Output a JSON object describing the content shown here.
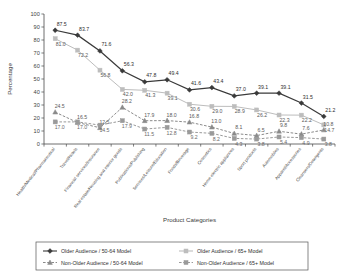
{
  "chart_data": {
    "type": "line",
    "title": "",
    "xlabel": "Product Categories",
    "ylabel": "Percentage",
    "ylim": [
      0,
      100
    ],
    "yticks": [
      0,
      10,
      20,
      30,
      40,
      50,
      60,
      70,
      80,
      90,
      100
    ],
    "grid": false,
    "legend_position": "bottom",
    "categories": [
      "Health/Medical/Pharmaceutical",
      "Travel/Hotels",
      "Financial services/Insurance",
      "Real estate/Housing and interior goods",
      "Publications/Publishing",
      "Services/Leisure/Education",
      "Foods/Beverage",
      "Cosmetics",
      "Home electric appliances",
      "Sport products",
      "Automobiles",
      "Apparel/Accessories",
      "Cleansers/Detergents"
    ],
    "series": [
      {
        "name": "Older Audience / 50-64 Model",
        "color": "#3a3a3a",
        "marker": "diamond",
        "dash": "none",
        "values": [
          87.5,
          83.7,
          71.6,
          56.3,
          47.8,
          49.4,
          41.6,
          43.4,
          37.0,
          39.1,
          39.1,
          31.5,
          21.2
        ]
      },
      {
        "name": "Older Audience / 65+ Model",
        "color": "#bdbdbd",
        "marker": "square",
        "dash": "none",
        "values": [
          81.0,
          72.2,
          56.8,
          42.0,
          41.3,
          39.1,
          30.6,
          29.0,
          28.9,
          26.2,
          22.3,
          22.2,
          14.7
        ]
      },
      {
        "name": "Non-Older Audience / 50-64 Model",
        "color": "#8a8a8a",
        "marker": "triangle",
        "dash": "dashed",
        "values": [
          24.5,
          16.5,
          12.5,
          28.2,
          17.9,
          18.0,
          16.8,
          13.0,
          8.1,
          6.5,
          9.8,
          7.6,
          10.8
        ]
      },
      {
        "name": "Non-Older Audience / 65+ Model",
        "color": "#9a9a9a",
        "marker": "square",
        "dash": "dashed",
        "values": [
          17.0,
          17.0,
          14.5,
          17.9,
          11.5,
          12.8,
          9.2,
          8.2,
          4.3,
          3.8,
          5.4,
          4.9,
          3.8
        ]
      }
    ],
    "extra_labels": {
      "series_2_tail": [
        4.9,
        3.8
      ],
      "series_3_tail": [
        1.8,
        3.2
      ]
    }
  },
  "legend": {
    "items": [
      {
        "label": "Older Audience / 50-64 Model"
      },
      {
        "label": "Older Audience / 65+ Model"
      },
      {
        "label": "Non-Older Audience / 50-64 Model"
      },
      {
        "label": "Non-Older Audience / 65+ Model"
      }
    ]
  },
  "axes": {
    "y_title": "Percentage",
    "x_title": "Product Categories"
  }
}
